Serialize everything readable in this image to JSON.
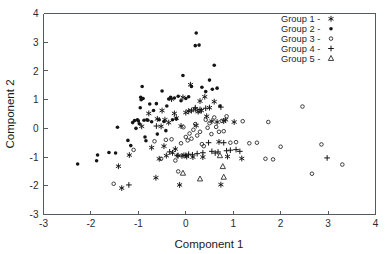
{
  "chart_data": {
    "type": "scatter",
    "title": "",
    "xlabel": "Component 1",
    "ylabel": "Component 2",
    "xlim": [
      -3,
      4
    ],
    "ylim": [
      -3,
      4
    ],
    "xticks": [
      "-3",
      "-2",
      "-1",
      "0",
      "1",
      "2",
      "3",
      "4"
    ],
    "yticks": [
      "-3",
      "-2",
      "-1",
      "0",
      "1",
      "2",
      "3",
      "4"
    ],
    "grid": false,
    "legend_position": "top-right",
    "legend_entries": [
      "Group 1 -",
      "Group 2 -",
      "Group 3 -",
      "Group 4 -",
      "Group 5 -"
    ],
    "series": [
      {
        "name": "Group 1",
        "marker": "star",
        "color": "#141414",
        "points": [
          [
            -1.42,
            -1.32
          ],
          [
            -1.35,
            -2.08
          ],
          [
            -1.19,
            -0.93
          ],
          [
            -0.93,
            0.07
          ],
          [
            -0.78,
            0.52
          ],
          [
            -0.72,
            -0.67
          ],
          [
            -0.63,
            -1.72
          ],
          [
            -0.6,
            0.33
          ],
          [
            -0.56,
            -1.06
          ],
          [
            -0.52,
            0.07
          ],
          [
            -0.5,
            0.62
          ],
          [
            -0.46,
            -0.62
          ],
          [
            -0.44,
            0.3
          ],
          [
            -0.41,
            -0.95
          ],
          [
            -0.36,
            0.2
          ],
          [
            -0.3,
            1.02
          ],
          [
            -0.28,
            -0.85
          ],
          [
            -0.24,
            0.52
          ],
          [
            -0.22,
            -0.72
          ],
          [
            -0.2,
            0.36
          ],
          [
            -0.16,
            -0.95
          ],
          [
            -0.13,
            -1.97
          ],
          [
            -0.1,
            0.08
          ],
          [
            -0.06,
            1.08
          ],
          [
            -0.04,
            -0.94
          ],
          [
            0.0,
            0.55
          ],
          [
            0.02,
            -0.98
          ],
          [
            0.06,
            0.6
          ],
          [
            0.1,
            1.52
          ],
          [
            0.12,
            0.62
          ],
          [
            0.15,
            -1.0
          ],
          [
            0.2,
            0.66
          ],
          [
            0.22,
            0.1
          ],
          [
            0.26,
            0.58
          ],
          [
            0.3,
            0.95
          ],
          [
            0.33,
            0.62
          ],
          [
            0.36,
            -1.0
          ],
          [
            0.4,
            1.1
          ],
          [
            0.44,
            0.42
          ],
          [
            0.5,
            0.72
          ],
          [
            0.55,
            0.25
          ],
          [
            0.6,
            0.93
          ],
          [
            0.66,
            0.22
          ],
          [
            0.7,
            -0.47
          ],
          [
            0.74,
            -1.96
          ],
          [
            0.8,
            0.25
          ],
          [
            0.84,
            0.3
          ],
          [
            0.88,
            -0.98
          ],
          [
            1.02,
            0.22
          ],
          [
            1.18,
            -1.05
          ]
        ]
      },
      {
        "name": "Group 2",
        "marker": "filled-circle",
        "color": "#141414",
        "points": [
          [
            -2.28,
            -1.24
          ],
          [
            -1.88,
            -1.13
          ],
          [
            -1.86,
            -0.93
          ],
          [
            -1.62,
            -0.84
          ],
          [
            -1.48,
            -0.86
          ],
          [
            -1.44,
            0.04
          ],
          [
            -1.22,
            -0.42
          ],
          [
            -1.16,
            -0.6
          ],
          [
            -1.12,
            0.2
          ],
          [
            -1.08,
            0.27
          ],
          [
            -1.05,
            0.0
          ],
          [
            -1.02,
            0.3
          ],
          [
            -1.0,
            0.26
          ],
          [
            -0.98,
            0.16
          ],
          [
            -0.96,
            0.72
          ],
          [
            -0.95,
            1.08
          ],
          [
            -0.94,
            1.0
          ],
          [
            -0.92,
            1.46
          ],
          [
            -0.9,
            1.04
          ],
          [
            -0.88,
            0.28
          ],
          [
            -0.86,
            -0.3
          ],
          [
            -0.84,
            -0.43
          ],
          [
            -0.82,
            0.3
          ],
          [
            -0.8,
            0.28
          ],
          [
            -0.76,
            0.85
          ],
          [
            -0.72,
            0.23
          ],
          [
            -0.68,
            0.62
          ],
          [
            -0.62,
            0.86
          ],
          [
            -0.6,
            -0.2
          ],
          [
            -0.56,
            0.3
          ],
          [
            -0.5,
            1.3
          ],
          [
            -0.46,
            0.24
          ],
          [
            -0.42,
            -0.08
          ],
          [
            -0.4,
            0.78
          ],
          [
            -0.36,
            1.02
          ],
          [
            -0.32,
            1.08
          ],
          [
            -0.28,
            0.3
          ],
          [
            -0.24,
            1.06
          ],
          [
            -0.2,
            0.33
          ],
          [
            -0.16,
            1.12
          ],
          [
            -0.1,
            0.96
          ],
          [
            -0.06,
            1.84
          ],
          [
            0.0,
            1.04
          ],
          [
            0.06,
            1.1
          ],
          [
            0.12,
            1.46
          ],
          [
            0.2,
            2.88
          ],
          [
            0.22,
            3.32
          ],
          [
            0.28,
            2.9
          ],
          [
            0.34,
            1.43
          ],
          [
            0.42,
            1.28
          ],
          [
            0.5,
            1.68
          ],
          [
            0.56,
            1.36
          ],
          [
            0.6,
            2.2
          ],
          [
            0.66,
            1.4
          ],
          [
            0.72,
            0.78
          ]
        ]
      },
      {
        "name": "Group 3",
        "marker": "open-circle",
        "color": "#2a2a2a",
        "points": [
          [
            -1.52,
            -1.93
          ],
          [
            -1.1,
            -0.75
          ],
          [
            -0.66,
            -0.45
          ],
          [
            -0.52,
            -1.06
          ],
          [
            -0.42,
            -0.4
          ],
          [
            -0.3,
            -0.38
          ],
          [
            -0.22,
            -1.12
          ],
          [
            -0.16,
            -1.5
          ],
          [
            -0.1,
            -0.52
          ],
          [
            -0.05,
            0.04
          ],
          [
            0.0,
            -0.3
          ],
          [
            0.04,
            -0.42
          ],
          [
            0.08,
            -0.18
          ],
          [
            0.12,
            -0.36
          ],
          [
            0.16,
            -0.05
          ],
          [
            0.2,
            0.15
          ],
          [
            0.24,
            -0.25
          ],
          [
            0.28,
            0.6
          ],
          [
            0.3,
            -0.12
          ],
          [
            0.34,
            -0.55
          ],
          [
            0.38,
            -0.62
          ],
          [
            0.42,
            0.3
          ],
          [
            0.46,
            0.02
          ],
          [
            0.5,
            0.18
          ],
          [
            0.54,
            -0.2
          ],
          [
            0.6,
            0.38
          ],
          [
            0.64,
            0.05
          ],
          [
            0.7,
            -0.12
          ],
          [
            0.76,
            0.26
          ],
          [
            0.8,
            -0.1
          ],
          [
            0.86,
            0.42
          ],
          [
            0.94,
            -0.5
          ],
          [
            1.06,
            -0.48
          ],
          [
            1.2,
            0.25
          ],
          [
            1.34,
            -0.52
          ],
          [
            1.5,
            -0.5
          ],
          [
            1.68,
            -1.06
          ],
          [
            1.74,
            0.22
          ],
          [
            1.84,
            -1.08
          ],
          [
            2.0,
            -0.64
          ],
          [
            2.46,
            0.76
          ],
          [
            2.66,
            -1.58
          ],
          [
            2.86,
            -0.56
          ],
          [
            3.3,
            -1.26
          ]
        ]
      },
      {
        "name": "Group 4",
        "marker": "plus",
        "color": "#141414",
        "points": [
          [
            -1.2,
            -1.97
          ],
          [
            -0.62,
            0.08
          ],
          [
            -0.34,
            -0.82
          ],
          [
            -0.18,
            -0.95
          ],
          [
            -0.08,
            -0.96
          ],
          [
            0.0,
            -0.94
          ],
          [
            0.06,
            -0.9
          ],
          [
            0.14,
            -0.92
          ],
          [
            0.2,
            0.72
          ],
          [
            0.24,
            -0.88
          ],
          [
            0.3,
            0.66
          ],
          [
            0.36,
            -0.85
          ],
          [
            0.42,
            0.7
          ],
          [
            0.48,
            -0.5
          ],
          [
            0.55,
            -0.8
          ],
          [
            0.62,
            -0.86
          ],
          [
            0.68,
            -0.82
          ],
          [
            0.74,
            0.74
          ],
          [
            0.8,
            -0.5
          ],
          [
            0.86,
            -0.78
          ],
          [
            0.94,
            -0.76
          ],
          [
            1.06,
            -0.74
          ],
          [
            1.14,
            -0.8
          ],
          [
            2.98,
            -1.03
          ]
        ]
      },
      {
        "name": "Group 5",
        "marker": "triangle",
        "color": "#2a2a2a",
        "points": [
          [
            -0.06,
            -1.56
          ],
          [
            0.3,
            -1.76
          ],
          [
            0.72,
            -0.95
          ],
          [
            0.78,
            -1.33
          ],
          [
            0.8,
            -1.7
          ]
        ]
      }
    ]
  }
}
